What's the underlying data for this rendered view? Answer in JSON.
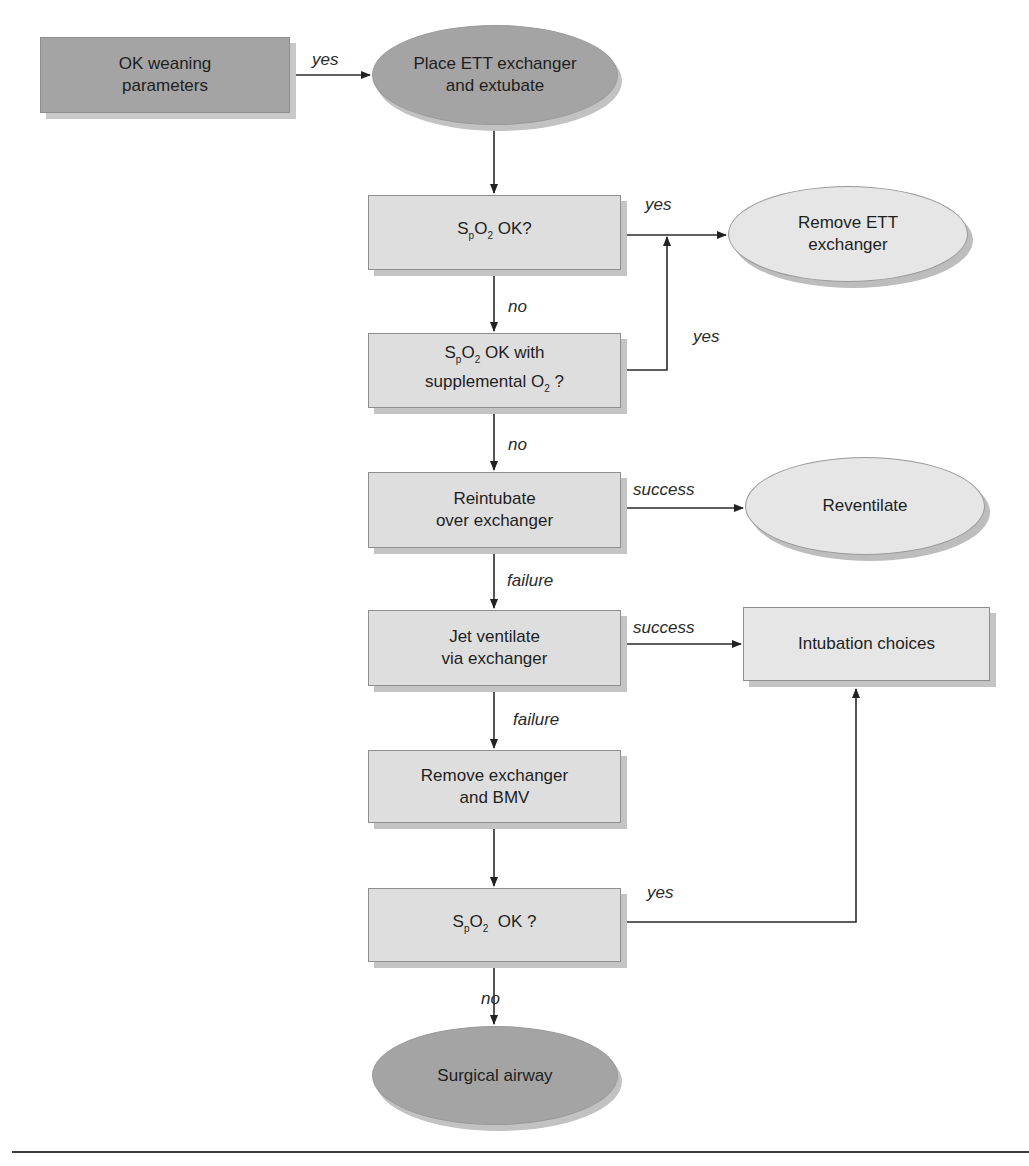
{
  "diagram": {
    "type": "flowchart",
    "nodes": {
      "ok_weaning": {
        "line1": "OK weaning",
        "line2": "parameters",
        "shape": "rectangle",
        "fill": "#a4a4a4"
      },
      "place_ett": {
        "line1": "Place ETT exchanger",
        "line2": "and extubate",
        "shape": "ellipse",
        "fill": "#a4a4a4"
      },
      "spo2_ok": {
        "prefix": "S",
        "sub1": "p",
        "mid": "O",
        "sub2": "2",
        "suffix": " OK?",
        "shape": "rectangle",
        "fill": "#dedede"
      },
      "spo2_supp": {
        "prefix": "S",
        "sub1": "p",
        "mid": "O",
        "sub2": "2",
        "suffix": " OK with",
        "line2_text": "supplemental O",
        "line2_sub": "2",
        "line2_suffix": " ?",
        "shape": "rectangle",
        "fill": "#dedede"
      },
      "reintubate": {
        "line1": "Reintubate",
        "line2": "over exchanger",
        "shape": "rectangle",
        "fill": "#dedede"
      },
      "jet_ventilate": {
        "line1": "Jet ventilate",
        "line2": "via exchanger",
        "shape": "rectangle",
        "fill": "#dedede"
      },
      "remove_exchanger_bmv": {
        "line1": "Remove exchanger",
        "line2": "and BMV",
        "shape": "rectangle",
        "fill": "#dedede"
      },
      "spo2_ok_final": {
        "prefix": "S",
        "sub1": "p",
        "mid": "O",
        "sub2": "2",
        "suffix": "  OK ?",
        "shape": "rectangle",
        "fill": "#dedede"
      },
      "surgical_airway": {
        "line1": "Surgical airway",
        "shape": "ellipse",
        "fill": "#a4a4a4"
      },
      "remove_ett": {
        "line1": "Remove ETT",
        "line2": "exchanger",
        "shape": "ellipse",
        "fill": "#e6e6e6"
      },
      "reventilate": {
        "line1": "Reventilate",
        "shape": "ellipse",
        "fill": "#e6e6e6"
      },
      "intubation_choices": {
        "line1": "Intubation choices",
        "shape": "rectangle",
        "fill": "#e6e6e6"
      }
    },
    "edges": [
      {
        "from": "ok_weaning",
        "to": "place_ett",
        "label": "yes"
      },
      {
        "from": "place_ett",
        "to": "spo2_ok",
        "label": ""
      },
      {
        "from": "spo2_ok",
        "to": "remove_ett",
        "label": "yes"
      },
      {
        "from": "spo2_ok",
        "to": "spo2_supp",
        "label": "no"
      },
      {
        "from": "spo2_supp",
        "to": "remove_ett",
        "label": "yes"
      },
      {
        "from": "spo2_supp",
        "to": "reintubate",
        "label": "no"
      },
      {
        "from": "reintubate",
        "to": "reventilate",
        "label": "success"
      },
      {
        "from": "reintubate",
        "to": "jet_ventilate",
        "label": "failure"
      },
      {
        "from": "jet_ventilate",
        "to": "intubation_choices",
        "label": "success"
      },
      {
        "from": "jet_ventilate",
        "to": "remove_exchanger_bmv",
        "label": "failure"
      },
      {
        "from": "remove_exchanger_bmv",
        "to": "spo2_ok_final",
        "label": ""
      },
      {
        "from": "spo2_ok_final",
        "to": "intubation_choices",
        "label": "yes"
      },
      {
        "from": "spo2_ok_final",
        "to": "surgical_airway",
        "label": "no"
      }
    ],
    "labels": {
      "yes": "yes",
      "no": "no",
      "success": "success",
      "failure": "failure"
    }
  }
}
